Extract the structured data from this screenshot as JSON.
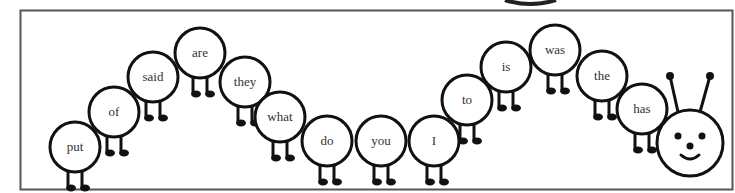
{
  "colors": {
    "stroke": "#111111",
    "frame": "#555555",
    "background": "#ffffff",
    "text": "#333333"
  },
  "segments": [
    {
      "word": "put",
      "cx": 75,
      "cy": 147
    },
    {
      "word": "of",
      "cx": 114,
      "cy": 112
    },
    {
      "word": "said",
      "cx": 153,
      "cy": 77
    },
    {
      "word": "are",
      "cx": 200,
      "cy": 53
    },
    {
      "word": "they",
      "cx": 245,
      "cy": 82
    },
    {
      "word": "what",
      "cx": 280,
      "cy": 117
    },
    {
      "word": "do",
      "cx": 327,
      "cy": 141
    },
    {
      "word": "you",
      "cx": 381,
      "cy": 141
    },
    {
      "word": "I",
      "cx": 434,
      "cy": 141
    },
    {
      "word": "to",
      "cx": 467,
      "cy": 100
    },
    {
      "word": "is",
      "cx": 506,
      "cy": 67
    },
    {
      "word": "was",
      "cx": 555,
      "cy": 50
    },
    {
      "word": "the",
      "cx": 602,
      "cy": 76
    },
    {
      "word": "has",
      "cx": 642,
      "cy": 109
    }
  ],
  "head": {
    "cx": 690,
    "cy": 143,
    "r": 33,
    "antennae": [
      {
        "x1": 678,
        "y1": 112,
        "x2": 670,
        "y2": 76
      },
      {
        "x1": 700,
        "y1": 112,
        "x2": 710,
        "y2": 76
      }
    ]
  }
}
